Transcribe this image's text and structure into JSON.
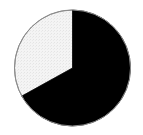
{
  "figure": {
    "name": "pie-chart",
    "background_color": "#ffffff",
    "width": 143,
    "height": 135
  },
  "chart_data": {
    "type": "pie",
    "title": "",
    "subtitle": "",
    "xlabel": "",
    "ylabel": "",
    "grid": false,
    "legend": "none",
    "labels": [
      "Slice 1",
      "Slice 2"
    ],
    "values": [
      67,
      33
    ],
    "angles_deg": [
      241,
      119
    ],
    "colors": [
      "#000000",
      "#f2f2f2"
    ],
    "start_angle_deg": 0,
    "direction": "clockwise",
    "annotations": [],
    "tick_labels": [],
    "data_labels": []
  },
  "geometry": {
    "center_x": 72.5,
    "center_y": 68,
    "radius": 58,
    "outline_color": "#8c8c8c",
    "divider_color": "#000000"
  }
}
